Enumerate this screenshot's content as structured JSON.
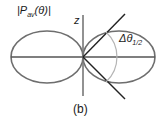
{
  "diagram": {
    "function_label": "|P",
    "function_sub": "av",
    "function_arg": "(θ)|",
    "axis_label": "z",
    "angle_label": "Δθ",
    "angle_sub": "1/2",
    "caption": "(b)"
  },
  "colors": {
    "lobe": "#6e6e6e",
    "axis": "#555555",
    "line": "#222222",
    "arc": "#b5b5b5"
  }
}
